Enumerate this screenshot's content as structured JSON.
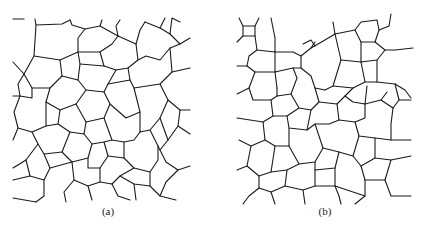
{
  "figure": {
    "panels": [
      {
        "id": "a",
        "label": "(a)",
        "description": "Coarser cellular/grain network with larger, more irregular polygonal cells",
        "stroke_color": "#1a1a1a",
        "paths": [
          "M13,19 L24,19",
          "M35,19 L36,25 L62,24 L70,20",
          "M36,25 L34,56 L60,60 L78,52 L78,38 L85,29 L100,26 L102,20",
          "M70,20 L72,25 L85,29",
          "M100,26 L118,36 L116,26 L120,20",
          "M118,36 L136,44 L140,30 L145,22",
          "M136,44 L138,60 L128,68 L116,70 L104,66 L100,52 L112,44 L118,36",
          "M100,52 L78,52",
          "M60,60 L62,76 L50,88 L32,88 L24,74 L34,56",
          "M13,62 L24,74",
          "M24,74 L18,84 L20,96 L32,98 L32,88",
          "M13,96 L20,96",
          "M62,76 L78,80 L86,90 L76,104 L60,110 L46,102 L50,88",
          "M78,52 L80,64 L78,80",
          "M80,64 L104,66",
          "M86,90 L104,92 L110,104 L104,118 L86,122 L76,104",
          "M104,92 L108,84 L116,70",
          "M108,84 L130,80 L134,88 L140,112 L126,118 L110,104",
          "M128,68 L130,80",
          "M134,88 L160,84 L172,72 L190,68",
          "M138,60 L146,56 L160,60 L170,48 L180,44 L190,38",
          "M145,22 L160,28 L170,34 L180,44",
          "M160,28 L165,18",
          "M170,34 L172,18 L180,22",
          "M172,72 L170,48",
          "M160,84 L168,100 L160,118 L150,130 L140,132 L140,112",
          "M168,100 L180,110 L190,110",
          "M180,110 L178,126 L190,134",
          "M178,126 L168,140 L160,150 L166,162 L178,170 L190,166",
          "M160,118 L168,140",
          "M150,130 L158,146 L160,150",
          "M140,132 L134,140 L124,142 L112,140 L104,118",
          "M20,96 L14,112 L18,128 L32,132 L46,126 L46,102",
          "M60,110 L58,124 L46,126",
          "M58,124 L70,132 L84,134 L86,122",
          "M84,134 L92,144 L88,158 L72,162 L62,152 L70,132",
          "M92,144 L104,142 L112,140",
          "M104,142 L108,156 L100,168 L88,168 L88,158",
          "M108,156 L124,158 L124,142",
          "M124,158 L134,168 L150,172 L158,160 L158,146",
          "M62,152 L44,154 L38,144 L32,132",
          "M13,140 L18,128",
          "M38,144 L26,160 L30,176 L44,180 L50,168 L44,154",
          "M13,168 L26,160",
          "M50,168 L72,162",
          "M44,180 L44,196 L36,202",
          "M30,176 L13,180",
          "M72,162 L74,180 L64,192 L66,202",
          "M74,180 L88,186 L100,182 L100,168",
          "M88,186 L92,200",
          "M100,182 L112,184 L118,196 L130,200",
          "M112,184 L120,176 L134,168",
          "M120,176 L134,184 L150,186 L150,172",
          "M150,186 L160,196 L176,200",
          "M160,196 L166,182 L178,170",
          "M134,184 L136,200",
          "M13,198 L36,202"
        ]
      },
      {
        "id": "b",
        "label": "(b)",
        "description": "Finer cellular/grain network with smaller, more numerous polygonal cells",
        "stroke_color": "#1a1a1a",
        "paths": [
          "M24,18 L28,26 L40,26 L44,18",
          "M28,26 L28,36 L22,42",
          "M28,36 L40,36 L40,26",
          "M40,36 L42,50 L60,52 L60,38 L56,18",
          "M60,52 L78,52 L86,56 L96,48 L100,42",
          "M42,50 L34,56 L32,66 L22,66",
          "M32,66 L40,72 L60,72 L60,52",
          "M60,72 L78,68 L82,78 L76,94 L62,96 L62,88",
          "M40,72 L34,88 L22,94",
          "M34,88 L38,100 L56,100 L62,96",
          "M62,88 L60,72",
          "M86,56 L86,68 L96,76 L100,88 L110,90",
          "M78,68 L86,68",
          "M96,48 L110,40 L120,34 L118,22",
          "M88,44 L96,40 L100,46",
          "M120,34 L140,30 L146,22 L162,20 L164,30",
          "M140,30 L146,42 L160,42 L164,30 L174,26 L176,14",
          "M160,42 L170,50 L180,50 L198,48",
          "M146,42 L146,62 L162,60 L170,50",
          "M120,34 L126,60 L118,86 L110,90",
          "M126,60 L146,62",
          "M146,62 L150,82 L162,82 L162,60",
          "M162,82 L180,84 L190,90 L196,98",
          "M180,84 L184,100 L196,100",
          "M150,82 L138,88 L130,96 L138,102 L150,104 L152,86",
          "M118,86 L138,88",
          "M150,104 L166,100 L172,92",
          "M166,100 L178,108 L184,100",
          "M178,108 L176,124 L176,140 L196,140",
          "M100,88 L104,102 L96,110 L84,108 L76,94",
          "M56,100 L58,116 L48,122 L22,118",
          "M58,116 L72,116 L84,108",
          "M72,116 L74,128 L92,130 L96,110",
          "M104,102 L122,104 L130,96",
          "M122,104 L124,120 L114,124 L100,124 L92,130",
          "M124,120 L140,122 L150,118 L150,104",
          "M140,122 L144,136 L160,138 L176,140",
          "M160,138 L160,158 L176,160 L196,156",
          "M144,136 L138,156 L146,166 L160,158",
          "M48,122 L50,140 L36,146 L24,140",
          "M50,140 L60,146 L74,146 L74,128",
          "M74,146 L84,164 L100,162 L108,148 L100,124",
          "M108,148 L124,152 L138,156",
          "M124,152 L120,168 L100,170 L100,162",
          "M36,146 L32,166 L22,170",
          "M32,166 L44,176 L56,172 L60,146",
          "M56,172 L72,170 L84,164",
          "M72,170 L70,186 L56,192 L44,188 L44,176",
          "M44,188 L34,196 L28,204",
          "M70,186 L88,190 L100,186 L100,170",
          "M88,190 L90,204",
          "M100,186 L120,186 L120,168",
          "M120,186 L124,196 L126,204",
          "M146,166 L150,180 L170,180 L176,160",
          "M150,180 L150,196 L140,204",
          "M120,186 L150,196",
          "M170,180 L176,196 L196,196",
          "M56,192 L60,204"
        ]
      }
    ]
  }
}
